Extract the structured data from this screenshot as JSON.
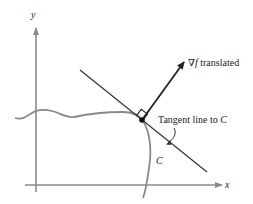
{
  "figure": {
    "axes": {
      "x_label": "x",
      "y_label": "y"
    },
    "labels": {
      "gradient": "∇f translated",
      "gradient_symbol": "∇",
      "gradient_f": "f",
      "gradient_rest": " translated",
      "tangent": "Tangent line to ",
      "tangent_c": "C",
      "curve": "C"
    },
    "colors": {
      "axis": "#8a8a8a",
      "curve": "#8a8a8a",
      "line": "#333333",
      "arrow": "#222222"
    }
  }
}
